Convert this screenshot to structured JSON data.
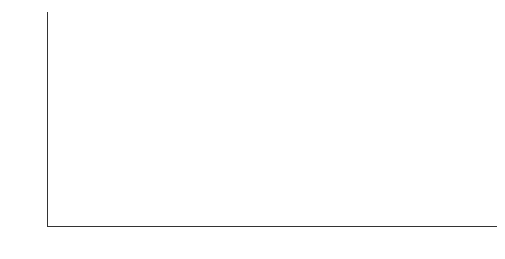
{
  "chart_data": {
    "type": "bar",
    "title": "",
    "xlabel": "年份",
    "ylabel": "万套",
    "categories": [
      "2012",
      "2013",
      "2014",
      "2015",
      "2016",
      "2017",
      "2018",
      "2019",
      "2020",
      "2021",
      "2022"
    ],
    "values": [
      2018.14,
      1982.3,
      1927.22,
      1877.26,
      1956.61,
      1906.15,
      1826.35,
      1982.98,
      1655.76,
      1359.57,
      1595.61
    ],
    "value_labels": [
      "2 018.14",
      "1 982.3",
      "1 927.22",
      "1 877.26",
      "1 956.61",
      "1 906.15",
      "1 826.35",
      "1 982.98",
      "1 655.76",
      "1 359.57",
      "1 595.61"
    ],
    "ylim": [
      0,
      2500
    ],
    "yticks": [
      0,
      500,
      1000,
      1500,
      2000,
      2500
    ],
    "ytick_labels": [
      "0",
      "500",
      "1 000",
      "1 500",
      "2 000",
      "2 500"
    ],
    "grid": false,
    "legend": null,
    "bar_color": "#666666"
  }
}
